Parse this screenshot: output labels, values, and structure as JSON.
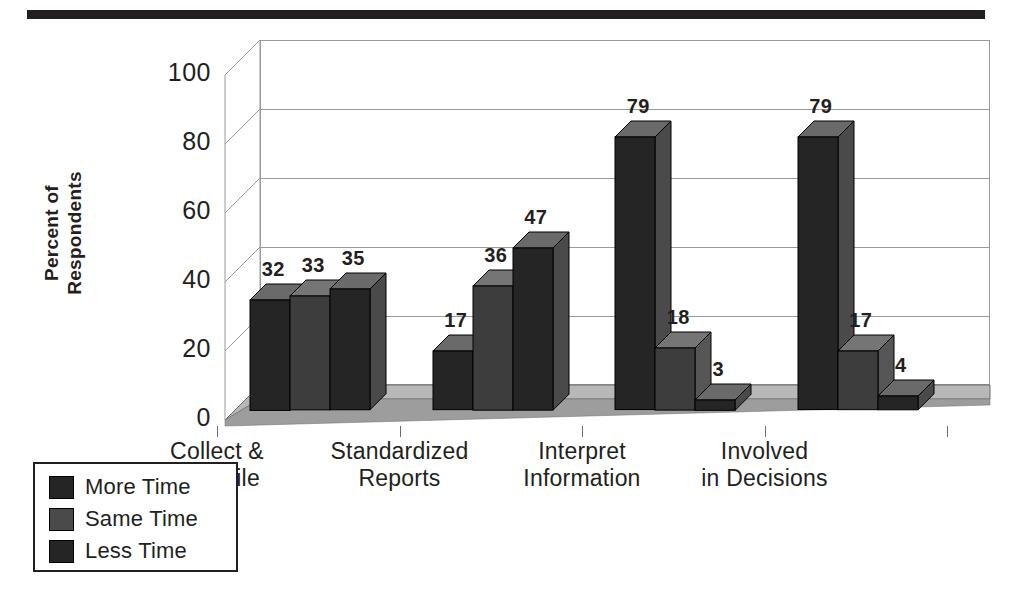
{
  "chart_data": {
    "type": "bar",
    "title": "",
    "subtitle": "",
    "xlabel": "",
    "ylabel": "Percent of Respondents",
    "ylabel_lines": [
      "Percent of",
      "Respondents"
    ],
    "ylim": [
      0,
      100
    ],
    "yticks": [
      0,
      20,
      40,
      60,
      80,
      100
    ],
    "ytick_labels": [
      "0",
      "20",
      "40",
      "60",
      "80",
      "100"
    ],
    "grid": true,
    "grid_orientation": "horizontal",
    "legend_position": "bottom-left",
    "style": "3d-grouped-bar",
    "categories": [
      "Collect & Compile",
      "Standardized Reports",
      "Interpret Information",
      "Involved in Decisions"
    ],
    "category_label_lines": [
      [
        "Collect &",
        "Compile"
      ],
      [
        "Standardized",
        "Reports"
      ],
      [
        "Interpret",
        "Information"
      ],
      [
        "Involved",
        "in Decisions"
      ]
    ],
    "series": [
      {
        "name": "More Time",
        "color": "#252525",
        "values": [
          32,
          17,
          79,
          79
        ]
      },
      {
        "name": "Same Time",
        "color": "#3d3d3d",
        "values": [
          33,
          36,
          18,
          17
        ]
      },
      {
        "name": "Less Time",
        "color": "#252525",
        "values": [
          35,
          47,
          3,
          4
        ]
      }
    ],
    "data_labels": [
      [
        "32",
        "33",
        "35"
      ],
      [
        "17",
        "36",
        "47"
      ],
      [
        "79",
        "18",
        "3"
      ],
      [
        "79",
        "17",
        "4"
      ]
    ]
  },
  "legend": {
    "items": [
      {
        "label": "More Time",
        "color": "#252525"
      },
      {
        "label": "Same Time",
        "color": "#4a4a4a"
      },
      {
        "label": "Less Time",
        "color": "#252525"
      }
    ]
  },
  "colors": {
    "rule": "#231f20",
    "text": "#231f20",
    "gridline": "#9a9a9a",
    "floor": "#b8b8b8",
    "floor_front": "#9d9d9d",
    "bar_front": "#252525",
    "bar_top": "#6a6a6a",
    "bar_side": "#4a4a4a",
    "bar_front_alt": "#3d3d3d",
    "bar_top_alt": "#757575",
    "bar_side_alt": "#565656"
  }
}
